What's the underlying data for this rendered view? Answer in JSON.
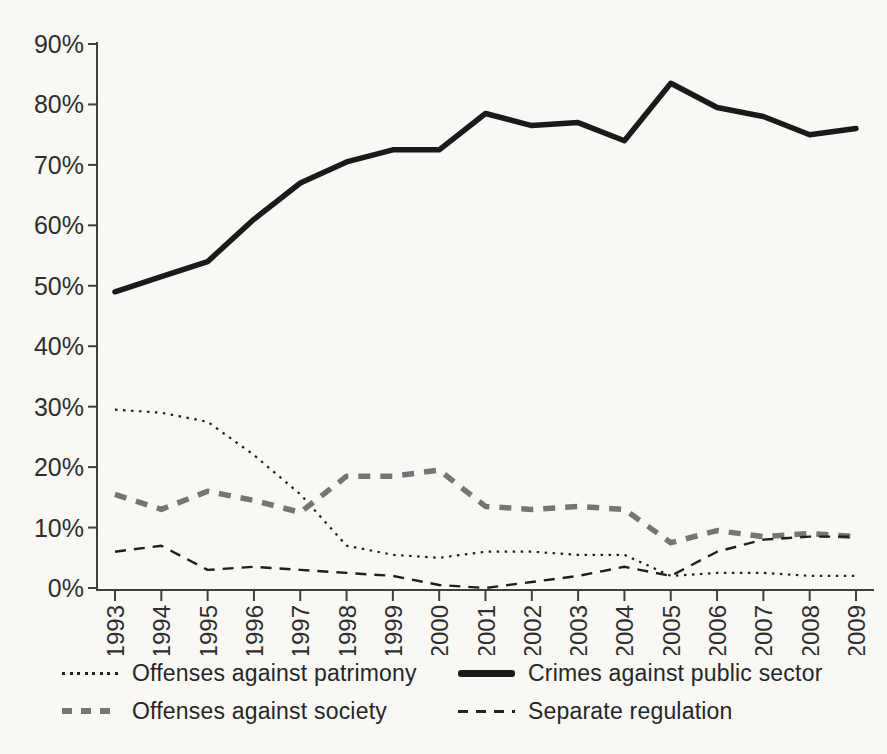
{
  "figure": {
    "background_color": "#f9f8f5",
    "ink_color": "#1f1f1f",
    "gray_series_color": "#757575"
  },
  "chart_data": {
    "type": "line",
    "title": "",
    "xlabel": "",
    "ylabel": "",
    "x_labels": [
      "1993",
      "1994",
      "1995",
      "1996",
      "1997",
      "1998",
      "1999",
      "2000",
      "2001",
      "2002",
      "2003",
      "2004",
      "2005",
      "2006",
      "2007",
      "2008",
      "2009"
    ],
    "ylim": [
      0,
      90
    ],
    "yticks": [
      0,
      10,
      20,
      30,
      40,
      50,
      60,
      70,
      80,
      90
    ],
    "ytick_suffix": "%",
    "grid": false,
    "legend_position": "bottom",
    "series": [
      {
        "name": "Offenses against patrimony",
        "style": {
          "color": "#1f1f1f",
          "width": 2.2,
          "dash": "2.5 5.5"
        },
        "values": [
          29.5,
          29,
          27.5,
          22,
          15.5,
          7,
          5.5,
          5,
          6,
          6,
          5.5,
          5.5,
          2,
          2.5,
          2.5,
          2,
          2
        ]
      },
      {
        "name": "Offenses against society",
        "style": {
          "color": "#757575",
          "width": 5.5,
          "dash": "12 10"
        },
        "values": [
          15.5,
          13,
          16,
          14.5,
          12.5,
          18.5,
          18.5,
          19.5,
          13.5,
          13,
          13.5,
          13,
          7.5,
          9.5,
          8.5,
          9,
          8.5
        ]
      },
      {
        "name": "Crimes against public sector",
        "style": {
          "color": "#1a1a1a",
          "width": 5.5,
          "dash": null
        },
        "values": [
          49,
          51.5,
          54,
          61,
          67,
          70.5,
          72.5,
          72.5,
          78.5,
          76.5,
          77,
          74,
          83.5,
          79.5,
          78,
          75,
          76
        ]
      },
      {
        "name": "Separate regulation",
        "style": {
          "color": "#1f1f1f",
          "width": 2.4,
          "dash": "11 8"
        },
        "values": [
          6,
          7,
          3,
          3.5,
          3,
          2.5,
          2,
          0.5,
          0,
          1,
          2,
          3.5,
          2,
          6,
          8,
          8.5,
          8.5
        ]
      }
    ]
  }
}
